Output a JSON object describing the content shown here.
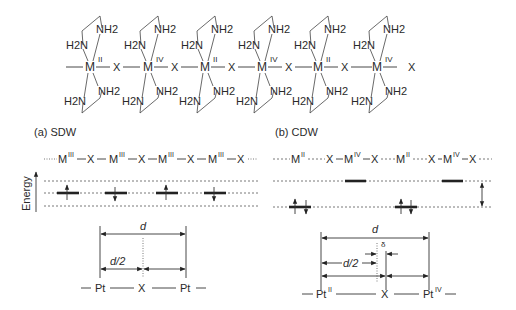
{
  "structure": {
    "ligand_upper": "NH2",
    "ligand_lower_left": "H2N",
    "ligand_upper_left": "H2N",
    "ligand_lower_right": "NH2",
    "metal_symbol": "M",
    "bridge_symbol": "X",
    "units": [
      {
        "metal": "M",
        "oxidation": "II"
      },
      {
        "metal": "M",
        "oxidation": "IV"
      },
      {
        "metal": "M",
        "oxidation": "II"
      },
      {
        "metal": "M",
        "oxidation": "IV"
      },
      {
        "metal": "M",
        "oxidation": "II"
      },
      {
        "metal": "M",
        "oxidation": "IV"
      }
    ]
  },
  "panel_a": {
    "title": "(a) SDW",
    "chain_metal": "M",
    "chain_oxidation": "III",
    "chain_bridge": "X",
    "energy_label": "Energy",
    "spins": [
      "up",
      "down",
      "up",
      "down"
    ],
    "distance_label": "d",
    "half_distance_label": "d/2",
    "bottom_atoms": [
      "Pt",
      "X",
      "Pt"
    ]
  },
  "panel_b": {
    "title": "(b) CDW",
    "chain": [
      {
        "metal": "M",
        "oxidation": "II"
      },
      {
        "metal": "M",
        "oxidation": "IV"
      },
      {
        "metal": "M",
        "oxidation": "II"
      },
      {
        "metal": "M",
        "oxidation": "IV"
      }
    ],
    "chain_bridge": "X",
    "levels": [
      "paired",
      "empty",
      "paired",
      "empty"
    ],
    "distance_label": "d",
    "half_distance_label": "d/2",
    "shift_label": "δ",
    "bottom_atoms": [
      {
        "atom": "Pt",
        "oxidation": "II"
      },
      {
        "atom": "X",
        "oxidation": ""
      },
      {
        "atom": "Pt",
        "oxidation": "IV"
      }
    ]
  }
}
